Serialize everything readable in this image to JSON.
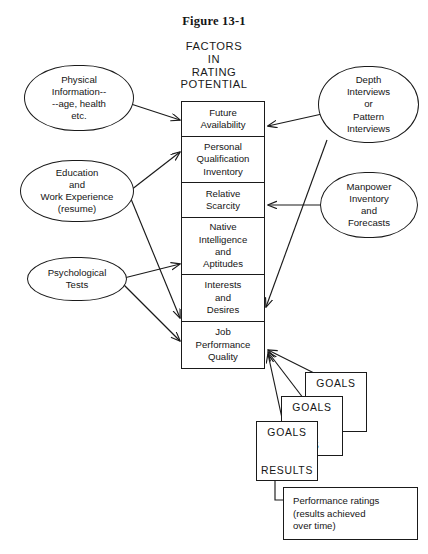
{
  "figure": {
    "caption": "Figure 13-1",
    "heading_lines": [
      "FACTORS",
      "IN",
      "RATING",
      "POTENTIAL"
    ]
  },
  "inputs_left": [
    {
      "id": "physical-information",
      "text": "Physical\nInformation--\n--age, health\netc."
    },
    {
      "id": "education-work-experience",
      "text": "Education\nand\nWork Experience\n(resume)"
    },
    {
      "id": "psychological-tests",
      "text": "Psychological\nTests"
    }
  ],
  "inputs_right": [
    {
      "id": "depth-interviews",
      "text": "Depth\nInterviews\nor\nPattern\nInterviews"
    },
    {
      "id": "manpower-inventory-forecasts",
      "text": "Manpower\nInventory\nand\nForecasts"
    }
  ],
  "factors_column": [
    {
      "id": "future-availability",
      "text": "Future\nAvailability"
    },
    {
      "id": "personal-qualification-inventory",
      "text": "Personal\nQualification\nInventory"
    },
    {
      "id": "relative-scarcity",
      "text": "Relative\nScarcity"
    },
    {
      "id": "native-intelligence-aptitudes",
      "text": "Native\nIntelligence\nand\nAptitudes"
    },
    {
      "id": "interests-desires",
      "text": "Interests\nand\nDesires"
    },
    {
      "id": "job-performance-quality",
      "text": "Job\nPerformance\nQuality"
    }
  ],
  "goal_cards": [
    {
      "id": "goals-card-back",
      "goals": "GOALS",
      "results": "TS"
    },
    {
      "id": "goals-card-middle",
      "goals": "GOALS",
      "results": "TS"
    },
    {
      "id": "goals-card-front",
      "goals": "GOALS",
      "results": "RESULTS"
    }
  ],
  "note": {
    "id": "performance-ratings-note",
    "text": "Performance ratings\n(results achieved\nover time)"
  },
  "style": {
    "ink": "#1a1a1a",
    "paper": "#ffffff"
  }
}
